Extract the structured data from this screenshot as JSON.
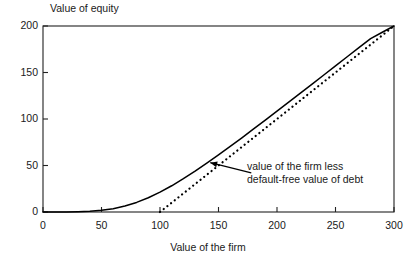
{
  "chart_data": {
    "type": "line",
    "title": "",
    "xlabel": "Value of the firm",
    "ylabel": "Value of equity",
    "xlim": [
      0,
      300
    ],
    "ylim": [
      0,
      200
    ],
    "xticks": [
      0,
      50,
      100,
      150,
      200,
      250,
      300
    ],
    "yticks": [
      0,
      50,
      100,
      150,
      200
    ],
    "xtick_labels": [
      "0",
      "50",
      "100",
      "150",
      "200",
      "250",
      "300"
    ],
    "ytick_labels": [
      "0",
      "50",
      "100",
      "150",
      "200"
    ],
    "grid": false,
    "legend": null,
    "frame": "full-box",
    "series": [
      {
        "name": "value of equity",
        "style": "solid",
        "color": "#000000",
        "x": [
          0,
          10,
          20,
          30,
          40,
          50,
          60,
          70,
          80,
          90,
          100,
          110,
          120,
          130,
          140,
          150,
          160,
          170,
          180,
          190,
          200,
          210,
          220,
          230,
          240,
          250,
          260,
          270,
          280,
          290,
          300
        ],
        "y": [
          0,
          0,
          0,
          0.3,
          0.8,
          1.8,
          3.6,
          6.4,
          10.3,
          15.3,
          21.3,
          28.2,
          35.8,
          43.9,
          52.5,
          61.4,
          70.5,
          79.8,
          89.3,
          98.8,
          108.4,
          118.1,
          127.8,
          137.5,
          147.3,
          157.1,
          166.9,
          176.7,
          186.5,
          193.3,
          200
        ]
      },
      {
        "name": "value of the firm less default-free value of debt",
        "style": "dotted",
        "color": "#000000",
        "x": [
          100,
          300
        ],
        "y": [
          0,
          200
        ]
      }
    ],
    "annotations": [
      {
        "name": "dashed-line-callout",
        "text_lines": [
          "value of the firm less",
          "default-free value of debt"
        ],
        "text_x": 170,
        "text_y": 47,
        "arrow_from_x": 178,
        "arrow_from_y": 42,
        "arrow_to_x": 143,
        "arrow_to_y": 53
      }
    ]
  },
  "annotation": {
    "line1": "value of the firm less",
    "line2": "default-free value of debt"
  }
}
